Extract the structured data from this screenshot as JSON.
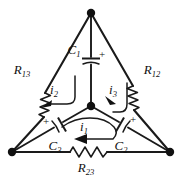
{
  "figure": {
    "type": "circuit-schematic",
    "background_color": "#ffffff",
    "line_color": "#1a1a1a"
  },
  "nodes": [
    {
      "name": "top-vertex",
      "x": 91,
      "y": 13
    },
    {
      "name": "bottom-left-vertex",
      "x": 12,
      "y": 152
    },
    {
      "name": "bottom-right-vertex",
      "x": 170,
      "y": 152
    },
    {
      "name": "center-node",
      "x": 91,
      "y": 106
    }
  ],
  "components": {
    "resistors": [
      {
        "id": "R13",
        "label": "R",
        "subscript": "13",
        "edge": "left",
        "label_x": 22,
        "label_y": 71
      },
      {
        "id": "R12",
        "label": "R",
        "subscript": "12",
        "edge": "right",
        "label_x": 140,
        "label_y": 71
      },
      {
        "id": "R23",
        "label": "R",
        "subscript": "23",
        "edge": "bottom",
        "label_x": 80,
        "label_y": 170
      }
    ],
    "capacitors": [
      {
        "id": "C1",
        "label": "C",
        "subscript": "1",
        "branch": "top-center",
        "polarity": "+",
        "polarity_side": "right",
        "label_x": 72,
        "label_y": 52
      },
      {
        "id": "C3",
        "label": "C",
        "subscript": "3",
        "branch": "center-left",
        "polarity": "+",
        "polarity_side": "left",
        "label_x": 52,
        "label_y": 146
      },
      {
        "id": "C2",
        "label": "C",
        "subscript": "2",
        "branch": "center-right",
        "polarity": "+",
        "polarity_side": "right",
        "label_x": 119,
        "label_y": 146
      }
    ],
    "mesh_currents": [
      {
        "id": "i1",
        "label": "i",
        "subscript": "1",
        "mesh": "bottom",
        "direction": "counterclockwise",
        "label_x": 81,
        "label_y": 128
      },
      {
        "id": "i2",
        "label": "i",
        "subscript": "2",
        "mesh": "left",
        "direction": "counterclockwise",
        "label_x": 53,
        "label_y": 91
      },
      {
        "id": "i3",
        "label": "i",
        "subscript": "3",
        "mesh": "right",
        "direction": "clockwise",
        "label_x": 108,
        "label_y": 91
      }
    ]
  },
  "signs": {
    "plus": "+"
  }
}
